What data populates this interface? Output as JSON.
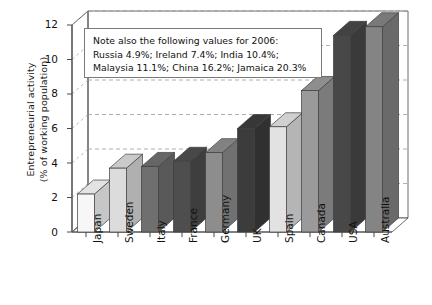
{
  "chart_data": {
    "type": "bar",
    "title": "",
    "subtitle": "",
    "xlabel": "",
    "ylabel": "Entrepreneurial activity (% of working population)",
    "ylabel_lines": [
      "Entrepreneurial activity",
      "(% of working population)"
    ],
    "categories": [
      "Japan",
      "Sweden",
      "Italy",
      "France",
      "Germany",
      "UK",
      "Spain",
      "Canada",
      "USA",
      "Australia"
    ],
    "values": [
      2.2,
      3.7,
      3.8,
      4.1,
      4.6,
      6.0,
      6.1,
      8.2,
      11.4,
      11.9
    ],
    "ylim": [
      0,
      12
    ],
    "yticks": [
      0,
      2,
      4,
      6,
      8,
      10,
      12
    ],
    "ytick_labels": [
      "0",
      "2",
      "4",
      "6",
      "8",
      "10",
      "12"
    ],
    "grid": true,
    "grid_axis": "y",
    "legend": "none",
    "style": "3d-columns",
    "bar_colors": [
      "#f7f7f7",
      "#dcdcdc",
      "#6f6f6f",
      "#4e4e4e",
      "#8d8d8d",
      "#3c3c3c",
      "#e2e2e2",
      "#9a9a9a",
      "#484848",
      "#848484"
    ],
    "annotations": [
      {
        "name": "note-box",
        "lines": [
          "Note also the following values for 2006:",
          "Russia 4.9%; Ireland 7.4%; India 10.4%;",
          "Malaysia 11.1%; China 16.2%; Jamaica 20.3%"
        ],
        "extra_values": [
          {
            "country": "Russia",
            "value": 4.9
          },
          {
            "country": "Ireland",
            "value": 7.4
          },
          {
            "country": "India",
            "value": 10.4
          },
          {
            "country": "Malaysia",
            "value": 11.1
          },
          {
            "country": "China",
            "value": 16.2
          },
          {
            "country": "Jamaica",
            "value": 20.3
          }
        ]
      }
    ]
  },
  "colors": {
    "axis": "#4a4a4a",
    "grid": "#9a9a9a",
    "text": "#111111",
    "note_border": "#7a7a7a",
    "floor": "#ffffff"
  }
}
